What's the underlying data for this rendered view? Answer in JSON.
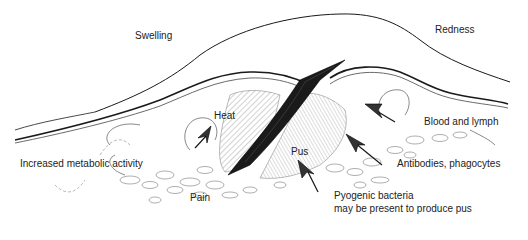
{
  "diagram": {
    "labels": {
      "swelling": "Swelling",
      "redness": "Redness",
      "heat": "Heat",
      "pus": "Pus",
      "blood_lymph": "Blood and lymph",
      "metabolic": "Increased metabolic activity",
      "antibodies": "Antibodies, phagocytes",
      "pain": "Pain",
      "pyogenic_line1": "Pyogenic bacteria",
      "pyogenic_line2": "may be present to produce pus"
    },
    "colors": {
      "ink": "#1a1a1a",
      "hatch": "#555555",
      "light_ink": "#888888",
      "background": "#ffffff"
    }
  }
}
